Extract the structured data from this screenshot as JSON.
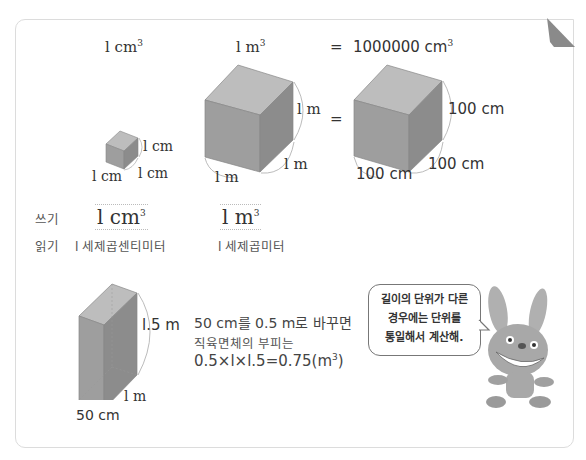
{
  "header": {
    "unit_cm3": "l cm",
    "unit_m3": "l m",
    "equals": "=",
    "big_value": "1000000 cm",
    "cube_exp": "3"
  },
  "small_cube": {
    "height": "l cm",
    "depth": "l cm",
    "width": "l cm"
  },
  "m_cube": {
    "height": "l m",
    "depth": "l m",
    "width": "l m"
  },
  "cm_cube": {
    "height": "100 cm",
    "depth": "100 cm",
    "width": "100 cm",
    "equals": "="
  },
  "writing": {
    "write_label": "쓰기",
    "read_label": "읽기",
    "write_cm3": "l cm",
    "write_m3": "l m",
    "read_cm3": "l 세제곱센티미터",
    "read_m3": "l 세제곱미터"
  },
  "cuboid": {
    "height": "l.5 m",
    "depth": "l m",
    "width": "50 cm"
  },
  "explanation": {
    "line1": "50 cm를 0.5 m로 바꾸면",
    "line2": "직육면체의 부피는",
    "line3": "0.5×l×l.5=0.75(m",
    "line3_end": ")"
  },
  "speech_bubble": {
    "line1": "길이의 단위가 다른",
    "line2": "경우에는 단위를",
    "line3": "통일해서 계산해."
  },
  "colors": {
    "cube_front": "#9e9e9e",
    "cube_top": "#bdbdbd",
    "cube_side": "#8c8c8c",
    "border": "#dcdcdc",
    "rabbit": "#a8a8a8"
  }
}
